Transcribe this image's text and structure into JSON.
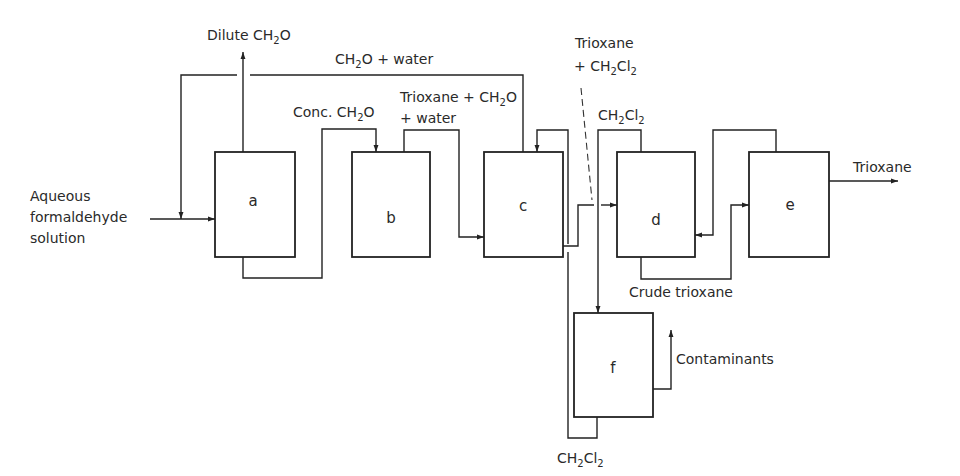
{
  "diagram": {
    "type": "process-flow",
    "units": [
      {
        "id": "a",
        "label": "a"
      },
      {
        "id": "b",
        "label": "b"
      },
      {
        "id": "c",
        "label": "c"
      },
      {
        "id": "d",
        "label": "d"
      },
      {
        "id": "e",
        "label": "e"
      },
      {
        "id": "f",
        "label": "f"
      }
    ],
    "streams": {
      "feed": {
        "line1": "Aqueous",
        "line2": "formaldehyde",
        "line3": "solution"
      },
      "dilute_ch2o": {
        "text": "Dilute CH",
        "sub": "2",
        "tail": "O"
      },
      "ch2o_water": {
        "text": "CH",
        "sub": "2",
        "tail": "O + water"
      },
      "conc_ch2o": {
        "text": "Conc. CH",
        "sub": "2",
        "tail": "O"
      },
      "trioxane_ch2o_water": {
        "line1_text": "Trioxane + CH",
        "line1_sub": "2",
        "line1_tail": "O",
        "line2": "+ water"
      },
      "trioxane_ch2cl2": {
        "line1": "Trioxane",
        "line2_text": "+ CH",
        "line2_sub1": "2",
        "line2_mid": "Cl",
        "line2_sub2": "2"
      },
      "ch2cl2_top": {
        "text": "CH",
        "sub1": "2",
        "mid": "Cl",
        "sub2": "2"
      },
      "trioxane_product": {
        "text": "Trioxane"
      },
      "crude_trioxane": {
        "text": "Crude trioxane"
      },
      "contaminants": {
        "text": "Contaminants"
      },
      "ch2cl2_bottom": {
        "text": "CH",
        "sub1": "2",
        "mid": "Cl",
        "sub2": "2"
      }
    },
    "colors": {
      "line": "#222222",
      "background": "#ffffff",
      "text": "#2a2a2a"
    }
  }
}
